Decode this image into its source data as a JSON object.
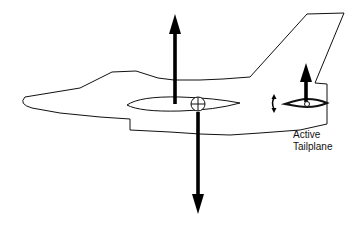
{
  "diagram": {
    "labels": {
      "tailplane_line1": "Active",
      "tailplane_line2": "Tailplane"
    },
    "forces": {
      "wing_lift": "upward-arrow",
      "weight": "downward-arrow",
      "tail_force": "upward-arrow-small"
    },
    "symbols": {
      "center_of_gravity": "cg-circle-cross",
      "tailplane_rotation": "pitch-rotation-arrow"
    },
    "colors": {
      "line": "#111111",
      "arrow": "#000000",
      "background": "#ffffff"
    }
  }
}
